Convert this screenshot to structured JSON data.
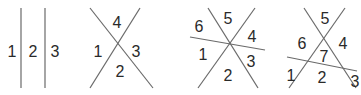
{
  "colors": {
    "line": "#6a6a6a",
    "label": "#2a2a2a",
    "background": "#ffffff"
  },
  "panels": [
    {
      "name": "two-parallel-lines",
      "region_count": 3,
      "lines": [
        {
          "x1": 21,
          "y1": 8,
          "x2": 21,
          "y2": 88
        },
        {
          "x1": 45,
          "y1": 8,
          "x2": 45,
          "y2": 88
        }
      ],
      "labels": [
        {
          "text": "1",
          "x": 12,
          "y": 51
        },
        {
          "text": "2",
          "x": 33,
          "y": 51
        },
        {
          "text": "3",
          "x": 55,
          "y": 51
        }
      ]
    },
    {
      "name": "two-intersecting-lines",
      "region_count": 4,
      "lines": [
        {
          "x1": 90,
          "y1": 8,
          "x2": 153,
          "y2": 88
        },
        {
          "x1": 140,
          "y1": 8,
          "x2": 90,
          "y2": 88
        }
      ],
      "labels": [
        {
          "text": "4",
          "x": 117,
          "y": 22
        },
        {
          "text": "1",
          "x": 98,
          "y": 51
        },
        {
          "text": "3",
          "x": 136,
          "y": 51
        },
        {
          "text": "2",
          "x": 120,
          "y": 71
        }
      ]
    },
    {
      "name": "three-concurrent-lines",
      "region_count": 6,
      "lines": [
        {
          "x1": 208,
          "y1": 8,
          "x2": 258,
          "y2": 88
        },
        {
          "x1": 255,
          "y1": 8,
          "x2": 198,
          "y2": 88
        },
        {
          "x1": 190,
          "y1": 37,
          "x2": 265,
          "y2": 50
        }
      ],
      "labels": [
        {
          "text": "6",
          "x": 199,
          "y": 26
        },
        {
          "text": "5",
          "x": 228,
          "y": 18
        },
        {
          "text": "4",
          "x": 252,
          "y": 36
        },
        {
          "text": "1",
          "x": 203,
          "y": 54
        },
        {
          "text": "3",
          "x": 251,
          "y": 61
        },
        {
          "text": "2",
          "x": 228,
          "y": 75
        }
      ]
    },
    {
      "name": "three-general-lines",
      "region_count": 7,
      "lines": [
        {
          "x1": 304,
          "y1": 8,
          "x2": 356,
          "y2": 88
        },
        {
          "x1": 345,
          "y1": 8,
          "x2": 289,
          "y2": 88
        },
        {
          "x1": 287,
          "y1": 57,
          "x2": 357,
          "y2": 71
        }
      ],
      "labels": [
        {
          "text": "5",
          "x": 325,
          "y": 18
        },
        {
          "text": "6",
          "x": 302,
          "y": 43
        },
        {
          "text": "4",
          "x": 343,
          "y": 43
        },
        {
          "text": "7",
          "x": 324,
          "y": 56
        },
        {
          "text": "1",
          "x": 291,
          "y": 75
        },
        {
          "text": "2",
          "x": 322,
          "y": 77
        },
        {
          "text": "3",
          "x": 355,
          "y": 81
        }
      ]
    }
  ]
}
